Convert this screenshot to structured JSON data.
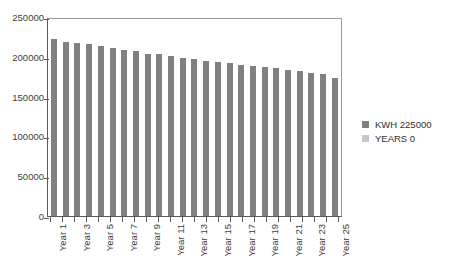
{
  "chart_data": {
    "type": "bar",
    "title": "",
    "subtitle": "",
    "xlabel": "",
    "ylabel": "",
    "ylim": [
      0,
      250000
    ],
    "ytick_labels": [
      "250000",
      "200000",
      "150000",
      "100000",
      "50000",
      "0"
    ],
    "ytick_values": [
      250000,
      200000,
      150000,
      100000,
      50000,
      0
    ],
    "grid": false,
    "legend_position": "right",
    "categories": [
      "Year 1",
      "Year 2",
      "Year 3",
      "Year 4",
      "Year 5",
      "Year 6",
      "Year 7",
      "Year 8",
      "Year 9",
      "Year 10",
      "Year 11",
      "Year 12",
      "Year 13",
      "Year 14",
      "Year 15",
      "Year 16",
      "Year 17",
      "Year 18",
      "Year 19",
      "Year 20",
      "Year 21",
      "Year 22",
      "Year 23",
      "Year 24",
      "Year 25"
    ],
    "xtick_labels_visible": [
      "Year 1",
      "",
      "Year 3",
      "",
      "Year 5",
      "",
      "Year 7",
      "",
      "Year 9",
      "",
      "Year 11",
      "",
      "Year 13",
      "",
      "Year 15",
      "",
      "Year 17",
      "",
      "Year 19",
      "",
      "Year 21",
      "",
      "Year 23",
      "",
      "Year 25"
    ],
    "series": [
      {
        "name": "KWH 225000",
        "color": "#808080",
        "values": [
          222000,
          219000,
          217000,
          216000,
          214000,
          211000,
          209000,
          207000,
          204000,
          203000,
          201000,
          199000,
          197000,
          195000,
          194000,
          192000,
          190000,
          189000,
          187000,
          186000,
          184000,
          182000,
          180000,
          178000,
          174000
        ]
      }
    ],
    "legend": [
      {
        "label": "KWH 225000",
        "color": "#808080"
      },
      {
        "label": "YEARS 0",
        "color": "#c8c8c8"
      }
    ]
  }
}
